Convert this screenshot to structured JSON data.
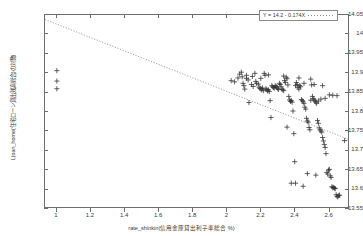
{
  "chart_data": {
    "type": "scatter",
    "title": "",
    "xlabel": "rate_shinkin(信用金庫貸出利子率総合  %)",
    "ylabel": "L(oan_home(住宅ローン貸出残高総合)の対数)",
    "xlim": [
      0.93,
      2.72
    ],
    "ylim": [
      13.55,
      14.05
    ],
    "xticks": [
      1,
      1.2,
      1.4,
      1.6,
      1.8,
      2,
      2.2,
      2.4,
      2.6
    ],
    "xtick_labels": [
      "1",
      "1.2",
      "1.4",
      "1.6",
      "1.8",
      "2",
      "2.2",
      "2.4",
      "2.6"
    ],
    "yticks": [
      13.55,
      13.6,
      13.65,
      13.7,
      13.75,
      13.8,
      13.85,
      13.9,
      13.95,
      14,
      14.05
    ],
    "ytick_labels": [
      "13.55",
      "13.6",
      "13.65",
      "13.7",
      "13.75",
      "13.8",
      "13.85",
      "13.9",
      "13.95",
      "14",
      "14.05"
    ],
    "grid": false,
    "marker": "plus",
    "marker_color": "#2e2e2e",
    "axis_color": "#6e6e6e",
    "legend": {
      "position": "top-right",
      "entries": [
        {
          "label": "Y = 14.2 - 0.174X",
          "style": "dotted-line",
          "color": "#8a8a8a"
        }
      ]
    },
    "fit_line": {
      "equation": "Y = 14.2 - 0.174X",
      "intercept": 14.2,
      "slope": -0.174,
      "style": "dotted",
      "color": "#8a8a8a",
      "x_start": 0.93,
      "x_end": 2.72
    },
    "points": [
      [
        1.0,
        13.905
      ],
      [
        1.0,
        13.878
      ],
      [
        1.0,
        13.858
      ],
      [
        2.03,
        13.879
      ],
      [
        2.05,
        13.876
      ],
      [
        2.07,
        13.886
      ],
      [
        2.08,
        13.896
      ],
      [
        2.09,
        13.901
      ],
      [
        2.095,
        13.889
      ],
      [
        2.1,
        13.872
      ],
      [
        2.105,
        13.866
      ],
      [
        2.11,
        13.857
      ],
      [
        2.12,
        13.885
      ],
      [
        2.13,
        13.881
      ],
      [
        2.135,
        13.822
      ],
      [
        2.15,
        13.869
      ],
      [
        2.16,
        13.864
      ],
      [
        2.17,
        13.898
      ],
      [
        2.175,
        13.877
      ],
      [
        2.18,
        13.872
      ],
      [
        2.19,
        13.87
      ],
      [
        2.195,
        13.862
      ],
      [
        2.2,
        13.859
      ],
      [
        2.205,
        13.858
      ],
      [
        2.21,
        13.855
      ],
      [
        2.215,
        13.86
      ],
      [
        2.22,
        13.853
      ],
      [
        2.225,
        13.898
      ],
      [
        2.23,
        13.893
      ],
      [
        2.235,
        13.858
      ],
      [
        2.24,
        13.856
      ],
      [
        2.245,
        13.852
      ],
      [
        2.25,
        13.855
      ],
      [
        2.255,
        13.851
      ],
      [
        2.26,
        13.827
      ],
      [
        2.265,
        13.783
      ],
      [
        2.27,
        13.866
      ],
      [
        2.275,
        13.863
      ],
      [
        2.28,
        13.861
      ],
      [
        2.285,
        13.86
      ],
      [
        2.29,
        13.866
      ],
      [
        2.295,
        13.864
      ],
      [
        2.3,
        13.862
      ],
      [
        2.305,
        13.858
      ],
      [
        2.31,
        13.856
      ],
      [
        2.315,
        13.872
      ],
      [
        2.32,
        13.869
      ],
      [
        2.325,
        13.863
      ],
      [
        2.33,
        13.857
      ],
      [
        2.335,
        13.855
      ],
      [
        2.34,
        13.853
      ],
      [
        2.345,
        13.879
      ],
      [
        2.35,
        13.874
      ],
      [
        2.355,
        13.888
      ],
      [
        2.36,
        13.884
      ],
      [
        2.365,
        13.868
      ],
      [
        2.37,
        13.838
      ],
      [
        2.375,
        13.829
      ],
      [
        2.38,
        13.825
      ],
      [
        2.385,
        13.827
      ],
      [
        2.39,
        13.823
      ],
      [
        2.395,
        13.8
      ],
      [
        2.4,
        13.741
      ],
      [
        2.405,
        13.668
      ],
      [
        2.41,
        13.612
      ],
      [
        2.415,
        13.874
      ],
      [
        2.42,
        13.869
      ],
      [
        2.425,
        13.861
      ],
      [
        2.43,
        13.857
      ],
      [
        2.435,
        13.866
      ],
      [
        2.44,
        13.863
      ],
      [
        2.445,
        13.83
      ],
      [
        2.45,
        13.827
      ],
      [
        2.455,
        13.824
      ],
      [
        2.46,
        13.82
      ],
      [
        2.465,
        13.81
      ],
      [
        2.47,
        13.805
      ],
      [
        2.475,
        13.781
      ],
      [
        2.48,
        13.774
      ],
      [
        2.485,
        13.771
      ],
      [
        2.49,
        13.757
      ],
      [
        2.495,
        13.751
      ],
      [
        2.5,
        13.883
      ],
      [
        2.505,
        13.868
      ],
      [
        2.51,
        13.838
      ],
      [
        2.515,
        13.832
      ],
      [
        2.52,
        13.829
      ],
      [
        2.525,
        13.826
      ],
      [
        2.53,
        13.823
      ],
      [
        2.535,
        13.82
      ],
      [
        2.54,
        13.775
      ],
      [
        2.545,
        13.768
      ],
      [
        2.55,
        13.756
      ],
      [
        2.555,
        13.751
      ],
      [
        2.56,
        13.748
      ],
      [
        2.565,
        13.745
      ],
      [
        2.57,
        13.731
      ],
      [
        2.575,
        13.722
      ],
      [
        2.58,
        13.713
      ],
      [
        2.585,
        13.705
      ],
      [
        2.59,
        13.689
      ],
      [
        2.595,
        13.64
      ],
      [
        2.6,
        13.636
      ],
      [
        2.605,
        13.646
      ],
      [
        2.61,
        13.648
      ],
      [
        2.615,
        13.631
      ],
      [
        2.62,
        13.627
      ],
      [
        2.625,
        13.603
      ],
      [
        2.63,
        13.6
      ],
      [
        2.635,
        13.601
      ],
      [
        2.64,
        13.599
      ],
      [
        2.645,
        13.598
      ],
      [
        2.65,
        13.582
      ],
      [
        2.655,
        13.578
      ],
      [
        2.66,
        13.576
      ],
      [
        2.665,
        13.58
      ],
      [
        2.67,
        13.581
      ],
      [
        2.41,
        13.866
      ],
      [
        2.46,
        13.872
      ],
      [
        2.52,
        13.869
      ],
      [
        2.57,
        13.866
      ],
      [
        2.61,
        13.842
      ],
      [
        2.63,
        13.841
      ],
      [
        2.655,
        13.84
      ],
      [
        2.5,
        13.828
      ],
      [
        2.545,
        13.826
      ],
      [
        2.56,
        13.831
      ],
      [
        2.585,
        13.833
      ],
      [
        2.455,
        13.604
      ],
      [
        2.48,
        13.637
      ],
      [
        2.53,
        13.633
      ],
      [
        2.7,
        13.723
      ],
      [
        2.385,
        13.612
      ],
      [
        2.36,
        13.758
      ],
      [
        2.205,
        13.885
      ],
      [
        2.12,
        13.893
      ],
      [
        2.155,
        13.89
      ],
      [
        2.25,
        13.894
      ],
      [
        2.34,
        13.891
      ],
      [
        2.43,
        13.886
      ]
    ]
  }
}
